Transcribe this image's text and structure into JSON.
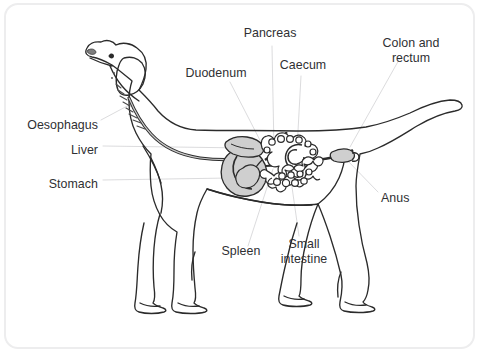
{
  "figure": {
    "style": "black line drawing on white, rounded light-grey frame",
    "frame_color": "#ededee",
    "line_color": "#2b2b2b",
    "organ_fill_color": "#cfcfcf",
    "label_color": "#2f3033",
    "background_color": "#ffffff"
  },
  "labels": [
    {
      "id": "pancreas",
      "text": "Pancreas",
      "align": "center",
      "x": 270,
      "y": 32,
      "leader_to": [
        283,
        152
      ]
    },
    {
      "id": "colon-rectum",
      "text": "Colon and\nrectum",
      "align": "center",
      "x": 411,
      "y": 42,
      "leader_to": [
        352,
        148
      ]
    },
    {
      "id": "caecum",
      "text": "Caecum",
      "align": "center",
      "x": 303,
      "y": 64,
      "leader_to": [
        295,
        168
      ]
    },
    {
      "id": "duodenum",
      "text": "Duodenum",
      "align": "center",
      "x": 216,
      "y": 72,
      "leader_to": [
        273,
        150
      ]
    },
    {
      "id": "oesophagus",
      "text": "Oesophagus",
      "align": "right",
      "x": 98,
      "y": 124,
      "leader_to": [
        110,
        110
      ]
    },
    {
      "id": "liver",
      "text": "Liver",
      "align": "right",
      "x": 98,
      "y": 149,
      "leader_to": [
        244,
        152
      ]
    },
    {
      "id": "stomach",
      "text": "Stomach",
      "align": "right",
      "x": 98,
      "y": 183,
      "leader_to": [
        250,
        175
      ]
    },
    {
      "id": "anus",
      "text": "Anus",
      "align": "left",
      "x": 381,
      "y": 197,
      "leader_to": [
        350,
        160
      ]
    },
    {
      "id": "spleen",
      "text": "Spleen",
      "align": "center",
      "x": 240,
      "y": 250,
      "leader_to": [
        268,
        170
      ]
    },
    {
      "id": "small-intestine",
      "text": "Small\nintestine",
      "align": "center",
      "x": 302,
      "y": 243,
      "leader_to": [
        290,
        180
      ]
    }
  ],
  "organs": [
    {
      "id": "oesophagus",
      "name": "Oesophagus"
    },
    {
      "id": "liver",
      "name": "Liver"
    },
    {
      "id": "stomach",
      "name": "Stomach"
    },
    {
      "id": "duodenum",
      "name": "Duodenum"
    },
    {
      "id": "pancreas",
      "name": "Pancreas"
    },
    {
      "id": "caecum",
      "name": "Caecum"
    },
    {
      "id": "colon-and-rectum",
      "name": "Colon and rectum"
    },
    {
      "id": "small-intestine",
      "name": "Small intestine"
    },
    {
      "id": "spleen",
      "name": "Spleen"
    },
    {
      "id": "anus",
      "name": "Anus"
    }
  ]
}
